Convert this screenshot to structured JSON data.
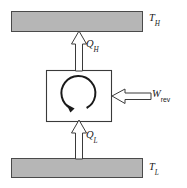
{
  "diagram": {
    "type": "thermodynamic-cycle-schematic",
    "colors": {
      "reservoir_fill": "#b6b6b6",
      "reservoir_stroke": "#4a4a4a",
      "engine_fill": "#ffffff",
      "engine_stroke": "#3a3a3a",
      "arrow_fill": "#ffffff",
      "arrow_stroke": "#3a3a3a",
      "cycle_arrow": "#1a1a1a",
      "background": "#ffffff",
      "text": "#1a1a1a"
    },
    "reservoirs": [
      {
        "id": "hot-reservoir",
        "label_symbol": "T",
        "label_subscript": "H",
        "label_text": "T_H",
        "position": "top"
      },
      {
        "id": "cold-reservoir",
        "label_symbol": "T",
        "label_subscript": "L",
        "label_text": "T_L",
        "position": "bottom"
      }
    ],
    "device": {
      "id": "reversible-cycle-device",
      "cycle_direction": "counterclockwise",
      "label_text": ""
    },
    "flows": [
      {
        "id": "heat-out-hot",
        "symbol": "Q",
        "subscript": "H",
        "subscript_style": "italic",
        "label_text": "Q_H",
        "direction": "up",
        "from": "device",
        "to": "hot-reservoir",
        "kind": "heat"
      },
      {
        "id": "heat-in-cold",
        "symbol": "Q",
        "subscript": "L",
        "subscript_style": "italic",
        "label_text": "Q_L",
        "direction": "up",
        "from": "cold-reservoir",
        "to": "device",
        "kind": "heat"
      },
      {
        "id": "work-input-reversible",
        "symbol": "W",
        "subscript": "rev",
        "subscript_style": "roman",
        "label_text": "W_rev",
        "direction": "left",
        "from": "surroundings",
        "to": "device",
        "kind": "work"
      }
    ]
  }
}
